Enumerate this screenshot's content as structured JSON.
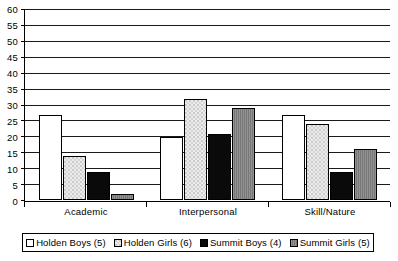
{
  "chart_data": {
    "type": "bar",
    "title": "",
    "subtitle": "",
    "xlabel": "",
    "ylabel": "",
    "categories": [
      "Academic",
      "Interpersonal",
      "Skill/Nature"
    ],
    "series": [
      {
        "name": "Holden Boys (5)",
        "fill": "white",
        "color": "#ffffff",
        "values": [
          27,
          20,
          27
        ]
      },
      {
        "name": "Holden Girls (6)",
        "fill": "stipple",
        "color": "#ececec",
        "values": [
          14,
          32,
          24
        ]
      },
      {
        "name": "Summit Boys (4)",
        "fill": "black",
        "color": "#0a0a0a",
        "values": [
          9,
          21,
          9
        ]
      },
      {
        "name": "Summit Girls (5)",
        "fill": "gray",
        "color": "#7d7d7d",
        "values": [
          2,
          29,
          16
        ]
      }
    ],
    "ylim": [
      0,
      60
    ],
    "ytick_step": 5,
    "yticks": [
      0,
      5,
      10,
      15,
      20,
      25,
      30,
      35,
      40,
      45,
      50,
      55,
      60
    ],
    "ytick_labels": [
      "0",
      "5",
      "10",
      "15",
      "20",
      "25",
      "30",
      "35",
      "40",
      "45",
      "50",
      "55",
      "60"
    ],
    "grid": true,
    "grid_axis": "y",
    "legend_position": "bottom",
    "legend_border": true,
    "axis_color": "#000000",
    "grid_color": "#1a1a1a",
    "background": "#ffffff"
  }
}
